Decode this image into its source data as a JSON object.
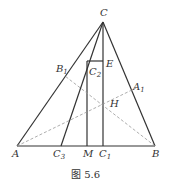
{
  "figure": {
    "caption": "图 5.6",
    "points": {
      "C": {
        "label": "C",
        "sub": ""
      },
      "A": {
        "label": "A",
        "sub": ""
      },
      "B": {
        "label": "B",
        "sub": ""
      },
      "B1": {
        "label": "B",
        "sub": "1"
      },
      "A1": {
        "label": "A",
        "sub": "1"
      },
      "C1": {
        "label": "C",
        "sub": "1"
      },
      "C2": {
        "label": "C",
        "sub": "2"
      },
      "C3": {
        "label": "C",
        "sub": "3"
      },
      "E": {
        "label": "E",
        "sub": ""
      },
      "H": {
        "label": "H",
        "sub": ""
      },
      "M": {
        "label": "M",
        "sub": ""
      }
    },
    "colors": {
      "line": "#333333",
      "dashed": "#888888"
    }
  }
}
